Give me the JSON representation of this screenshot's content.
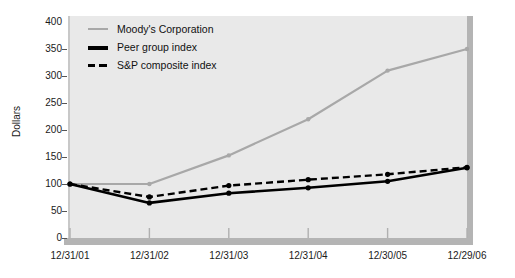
{
  "chart_data": {
    "type": "line",
    "title": "",
    "xlabel": "",
    "ylabel": "Dollars",
    "categories": [
      "12/31/01",
      "12/31/02",
      "12/31/03",
      "12/31/04",
      "12/30/05",
      "12/29/06"
    ],
    "ylim": [
      0,
      400
    ],
    "yticks": [
      0,
      50,
      100,
      150,
      200,
      250,
      300,
      350,
      400
    ],
    "grid": false,
    "legend_position": "top-left",
    "series": [
      {
        "name": "Moody's Corporation",
        "color": "#a8a8a8",
        "style": "solid",
        "values": [
          100,
          100,
          153,
          220,
          310,
          350
        ]
      },
      {
        "name": "Peer group index",
        "color": "#000000",
        "style": "solid-bold",
        "values": [
          100,
          65,
          83,
          93,
          105,
          130
        ]
      },
      {
        "name": "S&P composite index",
        "color": "#000000",
        "style": "dashed",
        "values": [
          100,
          76,
          97,
          108,
          118,
          131
        ]
      }
    ]
  },
  "legend": {
    "items": [
      {
        "label": "Moody's Corporation",
        "swatch": "line-gray-icon"
      },
      {
        "label": "Peer group index",
        "swatch": "line-black-icon"
      },
      {
        "label": "S&P composite index",
        "swatch": "line-dashed-icon"
      }
    ]
  },
  "axes": {
    "y_title": "Dollars",
    "y_labels": [
      "400",
      "350",
      "300",
      "250",
      "200",
      "150",
      "100",
      "50",
      "0"
    ],
    "x_labels": [
      "12/31/01",
      "12/31/02",
      "12/31/03",
      "12/31/04",
      "12/30/05",
      "12/29/06"
    ]
  },
  "colors": {
    "plot_background": "#e9e9e9",
    "shadow": "#b4b4b4",
    "moodys": "#a8a8a8",
    "peer": "#000000",
    "sp": "#000000",
    "text": "#1a1a1a"
  }
}
